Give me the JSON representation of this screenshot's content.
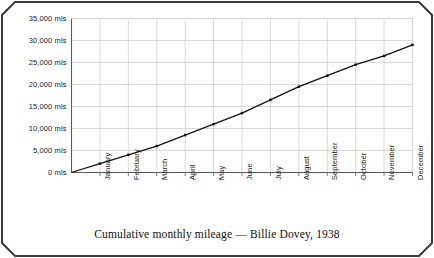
{
  "caption": "Cumulative monthly mileage — Billie Dovey, 1938",
  "colors": {
    "frame_border": "#3a3a3a",
    "background": "#ffffff",
    "line": "#111111",
    "marker": "#111111",
    "grid": "#c9c9c9",
    "axis": "#5a5a5a",
    "text": "#1a1a1a"
  },
  "chart_data": {
    "type": "line",
    "title": "Cumulative monthly mileage — Billie Dovey, 1938",
    "xlabel": "",
    "ylabel": "",
    "categories": [
      "January",
      "February",
      "March",
      "April",
      "May",
      "June",
      "July",
      "August",
      "September",
      "October",
      "November",
      "December"
    ],
    "values": [
      2000,
      4000,
      6000,
      8500,
      11000,
      13500,
      16500,
      19500,
      22000,
      24500,
      26500,
      29000
    ],
    "y_ticks": [
      0,
      5000,
      10000,
      15000,
      20000,
      25000,
      30000,
      35000
    ],
    "y_tick_labels": [
      "0 mls",
      "5,000 mls",
      "10,000 mls",
      "15,000 mls",
      "20,000 mls",
      "25,000 mls",
      "30,000 mls",
      "35,000 mls"
    ],
    "ylim": [
      0,
      35000
    ],
    "grid": true,
    "legend": false,
    "marker": "square",
    "series": [
      {
        "name": "Cumulative mileage",
        "values": [
          2000,
          4000,
          6000,
          8500,
          11000,
          13500,
          16500,
          19500,
          22000,
          24500,
          26500,
          29000
        ]
      }
    ]
  }
}
